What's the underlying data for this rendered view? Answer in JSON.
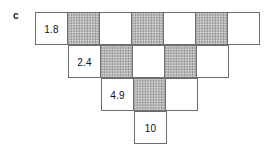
{
  "figure": {
    "panel_label": "c",
    "cell_size_px": 33,
    "border_color": "#6e6e6e",
    "shade_color": "#e8e8e8",
    "text_color": "#111111",
    "rows": [
      {
        "index": 0,
        "left_px": 35,
        "top_px": 12,
        "cells": [
          {
            "fill": "white",
            "value": "1.8"
          },
          {
            "fill": "shaded",
            "value": ""
          },
          {
            "fill": "white",
            "value": ""
          },
          {
            "fill": "shaded",
            "value": ""
          },
          {
            "fill": "white",
            "value": ""
          },
          {
            "fill": "shaded",
            "value": ""
          },
          {
            "fill": "white",
            "value": ""
          }
        ]
      },
      {
        "index": 1,
        "left_px": 68,
        "top_px": 45,
        "cells": [
          {
            "fill": "white",
            "value": "2.4"
          },
          {
            "fill": "shaded",
            "value": ""
          },
          {
            "fill": "white",
            "value": ""
          },
          {
            "fill": "shaded",
            "value": ""
          },
          {
            "fill": "white",
            "value": ""
          }
        ]
      },
      {
        "index": 2,
        "left_px": 101,
        "top_px": 78,
        "cells": [
          {
            "fill": "white",
            "value": "4.9"
          },
          {
            "fill": "shaded",
            "value": ""
          },
          {
            "fill": "white",
            "value": ""
          }
        ]
      },
      {
        "index": 3,
        "left_px": 134,
        "top_px": 111,
        "cells": [
          {
            "fill": "white",
            "value": "10"
          }
        ]
      }
    ]
  },
  "chart_data": {
    "type": "table",
    "title": "",
    "subtitle": "",
    "xlabel": "",
    "ylabel": "",
    "annotations": [
      "c"
    ],
    "row_cell_counts": [
      7,
      5,
      3,
      1
    ],
    "labeled_values": [
      1.8,
      2.4,
      4.9,
      10
    ],
    "labels_position": "leftmost cell of each row",
    "fill_pattern_per_row": [
      [
        "white",
        "shaded",
        "white",
        "shaded",
        "white",
        "shaded",
        "white"
      ],
      [
        "white",
        "shaded",
        "white",
        "shaded",
        "white"
      ],
      [
        "white",
        "shaded",
        "white"
      ],
      [
        "white"
      ]
    ],
    "values_per_row": [
      [
        "1.8",
        "",
        "",
        "",
        "",
        "",
        ""
      ],
      [
        "2.4",
        "",
        "",
        "",
        ""
      ],
      [
        "4.9",
        "",
        ""
      ],
      [
        "10"
      ]
    ],
    "grid": true,
    "legend": "none"
  }
}
